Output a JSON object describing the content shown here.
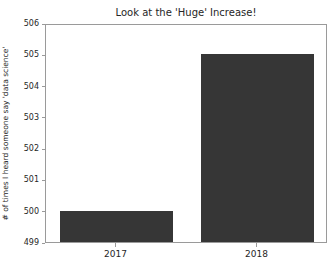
{
  "chart_data": {
    "type": "bar",
    "title": "Look at the 'Huge' Increase!",
    "xlabel": "",
    "ylabel": "# of times I heard someone say 'data science'",
    "categories": [
      "2017",
      "2018"
    ],
    "values": [
      500,
      505
    ],
    "ylim": [
      499,
      506
    ],
    "yticks": [
      499,
      500,
      501,
      502,
      503,
      504,
      505,
      506
    ],
    "ytick_labels": [
      "499",
      "500",
      "501",
      "502",
      "503",
      "504",
      "505",
      "506"
    ],
    "xtick_labels": [
      "2017",
      "2018"
    ],
    "grid": false,
    "legend": "none",
    "bar_color": "#363636",
    "background_color": "#ffffff",
    "axis_color": "#9a9a9a",
    "text_color": "#262626"
  }
}
